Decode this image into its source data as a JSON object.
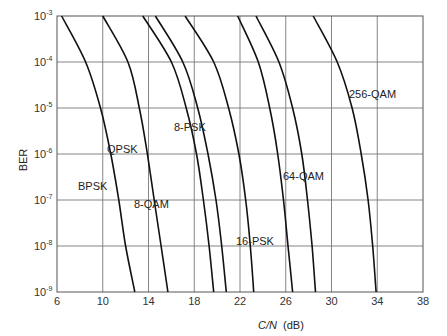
{
  "chart_data": {
    "type": "line",
    "title": "",
    "xlabel": "C/N (dB)",
    "xlabel_italic_part": "C/N",
    "xlabel_unit": "(dB)",
    "ylabel": "BER",
    "xlim": [
      6,
      38
    ],
    "ylim": [
      1e-09,
      0.001
    ],
    "yscale": "log",
    "grid": true,
    "legend": "inline labels",
    "x_ticks": [
      "6",
      "10",
      "14",
      "18",
      "22",
      "26",
      "30",
      "34",
      "38"
    ],
    "y_ticks": [
      {
        "base": "10",
        "exp": "-3"
      },
      {
        "base": "10",
        "exp": "-4"
      },
      {
        "base": "10",
        "exp": "-5"
      },
      {
        "base": "10",
        "exp": "-6"
      },
      {
        "base": "10",
        "exp": "-7"
      },
      {
        "base": "10",
        "exp": "-8"
      },
      {
        "base": "10",
        "exp": "-9"
      }
    ],
    "y_decades": [
      -3,
      -4,
      -5,
      -6,
      -7,
      -8,
      -9
    ],
    "series": [
      {
        "name": "BPSK",
        "label": "BPSK",
        "cn_db": [
          6.4,
          8.5,
          9.8,
          10.7,
          11.4,
          12.0,
          12.8
        ],
        "label_pos": [
          78,
          190
        ]
      },
      {
        "name": "QPSK",
        "label": "QPSK",
        "cn_db": [
          10.0,
          12.2,
          13.2,
          13.9,
          14.5,
          15.1,
          15.7
        ],
        "label_pos": [
          107,
          153
        ]
      },
      {
        "name": "8-QAM",
        "label": "8-QAM",
        "cn_db": [
          13.5,
          16.0,
          17.3,
          18.2,
          18.8,
          19.3,
          19.7
        ],
        "label_pos": [
          134,
          208
        ]
      },
      {
        "name": "8-PSK",
        "label": "8-PSK",
        "cn_db": [
          14.6,
          17.0,
          18.3,
          19.2,
          19.9,
          20.4,
          20.8
        ],
        "label_pos": [
          174,
          131
        ]
      },
      {
        "name": "16-QAM",
        "label": "",
        "cn_db": [
          17.2,
          19.7,
          21.0,
          21.9,
          22.5,
          22.9,
          23.2
        ],
        "label_pos": null
      },
      {
        "name": "16-PSK",
        "label": "16-PSK",
        "cn_db": [
          21.8,
          23.6,
          24.6,
          25.3,
          25.8,
          26.2,
          26.6
        ],
        "label_pos": [
          236,
          245
        ]
      },
      {
        "name": "64-QAM",
        "label": "64-QAM",
        "cn_db": [
          23.4,
          25.4,
          26.6,
          27.4,
          27.9,
          28.3,
          28.6
        ],
        "label_pos": [
          283,
          180
        ]
      },
      {
        "name": "256-QAM",
        "label": "256-QAM",
        "cn_db": [
          28.4,
          30.5,
          31.8,
          32.6,
          33.2,
          33.6,
          33.9
        ],
        "label_pos": [
          349,
          98
        ]
      }
    ]
  }
}
